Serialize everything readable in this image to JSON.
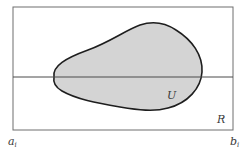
{
  "diagram": {
    "type": "set-region-figure",
    "colors": {
      "background": "#ffffff",
      "frame_stroke": "#6e6e6e",
      "axis_line": "#4a4a4a",
      "region_fill": "#d4d4d4",
      "region_stroke": "#1e1e1e",
      "label": "#3a3a3a"
    },
    "rectangle": {
      "label": "R"
    },
    "region": {
      "label": "U"
    },
    "axis": {
      "left_endpoint": {
        "base": "a",
        "subscript": "i"
      },
      "right_endpoint": {
        "base": "b",
        "subscript": "i"
      }
    }
  }
}
